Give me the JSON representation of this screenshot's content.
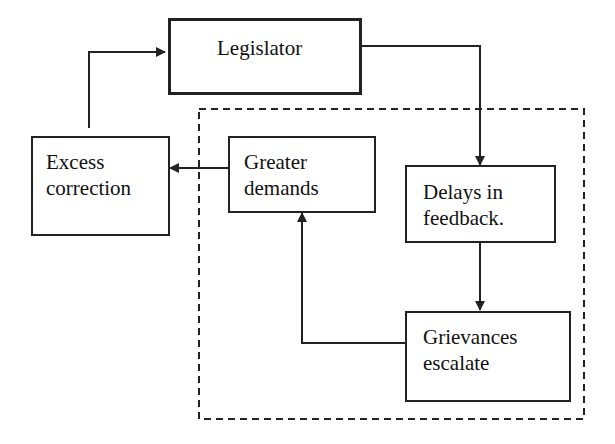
{
  "diagram": {
    "type": "flowchart",
    "nodes": [
      {
        "id": "legislator",
        "lines": [
          "Legislator"
        ]
      },
      {
        "id": "excess-correction",
        "lines": [
          "Excess",
          "correction"
        ]
      },
      {
        "id": "greater-demands",
        "lines": [
          "Greater",
          "demands"
        ]
      },
      {
        "id": "delays-in-feedback",
        "lines": [
          "Delays in",
          "feedback."
        ]
      },
      {
        "id": "grievances-escalate",
        "lines": [
          "Grievances",
          "escalate"
        ]
      }
    ],
    "edges": [
      {
        "from": "legislator",
        "to": "delays-in-feedback"
      },
      {
        "from": "delays-in-feedback",
        "to": "grievances-escalate"
      },
      {
        "from": "grievances-escalate",
        "to": "greater-demands"
      },
      {
        "from": "greater-demands",
        "to": "excess-correction"
      },
      {
        "from": "excess-correction",
        "to": "legislator"
      }
    ],
    "groups": [
      {
        "id": "dashed-group",
        "style": "dashed",
        "members": [
          "greater-demands",
          "delays-in-feedback",
          "grievances-escalate"
        ]
      }
    ],
    "colors": {
      "stroke": "#222222",
      "background": "#ffffff"
    }
  }
}
